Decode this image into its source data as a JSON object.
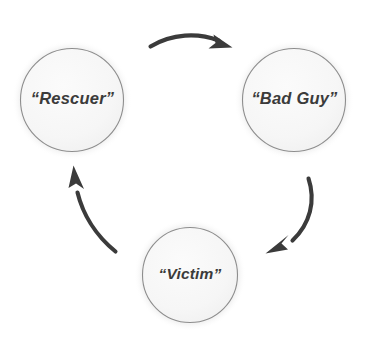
{
  "diagram": {
    "type": "cycle-diagram",
    "background_color": "#ffffff",
    "title_clipped": "",
    "nodes": [
      {
        "id": "rescuer",
        "label": "“Rescuer”",
        "position": "top-left",
        "cx": 72,
        "cy": 100,
        "radius": 52,
        "halo_radius": 60,
        "fill_color": "#f7f7f7",
        "border_color": "#8d8d8d",
        "halo_color": "#eeeeee",
        "text_color": "#3b3b3b"
      },
      {
        "id": "bad-guy",
        "label": "“Bad Guy”",
        "position": "top-right",
        "cx": 294,
        "cy": 100,
        "radius": 52,
        "halo_radius": 60,
        "fill_color": "#f7f7f7",
        "border_color": "#8d8d8d",
        "halo_color": "#eeeeee",
        "text_color": "#3b3b3b"
      },
      {
        "id": "victim",
        "label": "“Victim”",
        "position": "bottom-center",
        "cx": 190,
        "cy": 275,
        "radius": 48,
        "halo_radius": 56,
        "fill_color": "#f7f7f7",
        "border_color": "#8d8d8d",
        "halo_color": "#eeeeee",
        "text_color": "#3b3b3b"
      }
    ],
    "arrows": [
      {
        "id": "rescuer-to-badguy",
        "from": "rescuer",
        "to": "bad-guy",
        "direction": "rightward",
        "curve": "arc bowing upward",
        "color": "#3b3b3b"
      },
      {
        "id": "badguy-to-victim",
        "from": "bad-guy",
        "to": "victim",
        "direction": "down-left",
        "curve": "arc bowing right",
        "color": "#3b3b3b"
      },
      {
        "id": "victim-to-rescuer",
        "from": "victim",
        "to": "rescuer",
        "direction": "up-left",
        "curve": "arc bowing left",
        "color": "#3b3b3b"
      }
    ]
  }
}
